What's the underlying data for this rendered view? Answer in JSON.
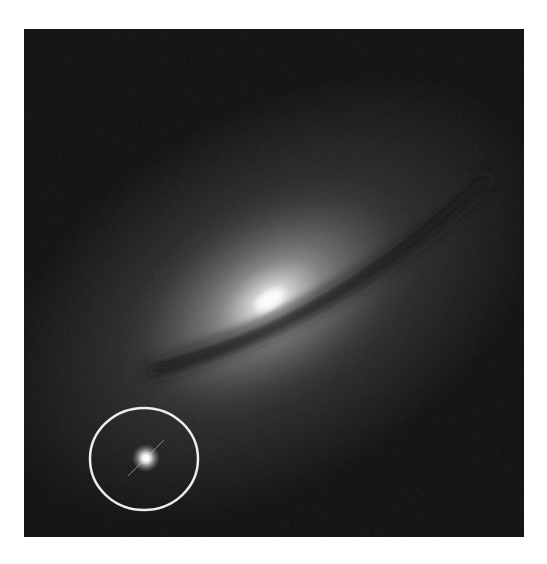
{
  "image": {
    "subject": "Edge-on spiral galaxy with dust lane and circled bright supernova point source",
    "colors": {
      "background": "#ffffff",
      "sky": "#0b0b0b",
      "galaxy_core": "#f4f4f4",
      "dust_lane": "#1c1c1c",
      "circle_stroke": "#f0f0f0"
    },
    "galaxy_core": {
      "x": 270,
      "y": 300
    },
    "supernova": {
      "x": 146,
      "y": 458
    },
    "highlight_circle": {
      "cx": 144,
      "cy": 459,
      "rx": 54,
      "ry": 51
    }
  }
}
